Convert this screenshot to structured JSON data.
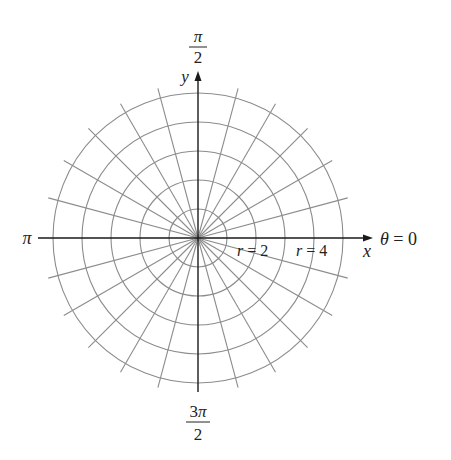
{
  "diagram": {
    "type": "polar-grid",
    "center": {
      "x": 198,
      "y": 238
    },
    "circle_spacing_px": 29,
    "circle_count": 5,
    "spoke_angle_step_deg": 15,
    "spoke_length_px": 155,
    "grid_color": "#8c8c8c",
    "axis_color": "#1a1a1a"
  },
  "labels": {
    "top_num": "π",
    "top_den": "2",
    "y_axis": "y",
    "left": "π",
    "x_axis": "x",
    "theta_zero": "θ = 0",
    "r2": "r = 2",
    "r4": "r = 4",
    "bottom_num": "3π",
    "bottom_den": "2"
  }
}
